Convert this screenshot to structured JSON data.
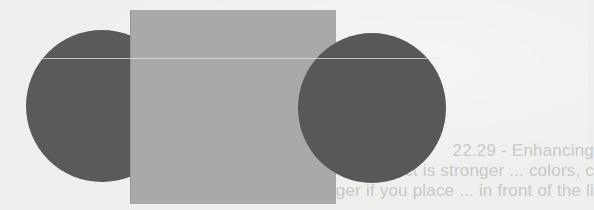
{
  "page": {
    "background_color": "#efefed",
    "type": "scanned-book-figure"
  },
  "figure": {
    "shapes": [
      {
        "id": "circle-left",
        "kind": "circle",
        "color": "#5a5a5a",
        "layer": "behind-rectangle"
      },
      {
        "id": "rect-center",
        "kind": "rectangle",
        "color": "#a9a9a9",
        "layer": "middle"
      },
      {
        "id": "circle-right",
        "kind": "circle",
        "color": "#585858",
        "layer": "front"
      }
    ],
    "scan_line_color": "#e1e1de"
  },
  "bleed_through": {
    "color": "#c9c9c7",
    "lines": [
      "22.29 - Enhancing",
      "ne effect is stronger ... colors, c",
      "nes yet stronger if you place ... in front of the li"
    ]
  }
}
